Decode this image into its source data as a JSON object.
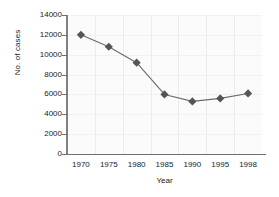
{
  "chart_data": {
    "type": "line",
    "title": "",
    "xlabel": "Year",
    "ylabel": "No. of cases",
    "categories": [
      "1970",
      "1975",
      "1980",
      "1985",
      "1990",
      "1995",
      "1998"
    ],
    "values": [
      12000,
      10800,
      9200,
      6000,
      5300,
      5600,
      6100
    ],
    "series": [
      {
        "name": "No. of cases",
        "values": [
          12000,
          10800,
          9200,
          6000,
          5300,
          5600,
          6100
        ]
      }
    ],
    "yticks": [
      0,
      2000,
      4000,
      6000,
      8000,
      10000,
      12000,
      14000
    ],
    "ytick_labels": [
      "0",
      "2000",
      "4000",
      "6000",
      "8000",
      "10000",
      "12000",
      "14000"
    ],
    "ylim": [
      0,
      14000
    ],
    "grid": true,
    "legend": "none",
    "marker": "diamond",
    "colors": {
      "marker": "#555555",
      "line": "#6b6b6b",
      "axis": "#6e6e6e",
      "grid": "#ececec",
      "plot_background": "#fbfbfb",
      "text": "#1a1a1a"
    }
  }
}
